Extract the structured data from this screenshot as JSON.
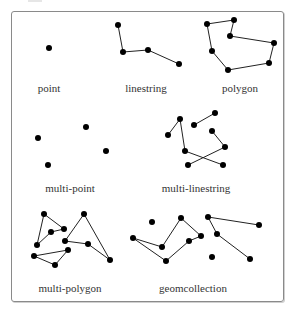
{
  "figure": {
    "stroke_color": "#222222",
    "vertex_color": "#000000",
    "vertex_radius": 3,
    "panels": [
      {
        "id": "point",
        "label": "point",
        "label_pos": [
          49,
          94
        ],
        "points": [
          [
            49,
            48
          ]
        ],
        "lines": [],
        "polygons": []
      },
      {
        "id": "linestring",
        "label": "linestring",
        "label_pos": [
          146,
          94
        ],
        "points": [],
        "lines": [
          [
            [
              118,
              25
            ],
            [
              123,
              52
            ],
            [
              148,
              50
            ],
            [
              179,
              64
            ]
          ]
        ],
        "polygons": []
      },
      {
        "id": "polygon",
        "label": "polygon",
        "label_pos": [
          240,
          94
        ],
        "points": [],
        "lines": [],
        "polygons": [
          [
            [
              207,
              24
            ],
            [
              234,
              20
            ],
            [
              230,
              36
            ],
            [
              274,
              43
            ],
            [
              269,
              63
            ],
            [
              228,
              70
            ],
            [
              212,
              51
            ]
          ]
        ]
      },
      {
        "id": "multi-point",
        "label": "multi-point",
        "label_pos": [
          70,
          194
        ],
        "points": [
          [
            38,
            138
          ],
          [
            86,
            127
          ],
          [
            106,
            151
          ],
          [
            48,
            165
          ]
        ],
        "lines": [],
        "polygons": []
      },
      {
        "id": "multi-linestring",
        "label": "multi-linestring",
        "label_pos": [
          196,
          194
        ],
        "points": [],
        "lines": [
          [
            [
              168,
              135
            ],
            [
              180,
              119
            ],
            [
              185,
              151
            ],
            [
              223,
              165
            ]
          ],
          [
            [
              194,
              125
            ],
            [
              215,
              113
            ]
          ],
          [
            [
              212,
              131
            ],
            [
              225,
              147
            ],
            [
              188,
              165
            ]
          ]
        ],
        "polygons": []
      },
      {
        "id": "multi-polygon",
        "label": "multi-polygon",
        "label_pos": [
          70,
          294
        ],
        "points": [],
        "lines": [],
        "polygons": [
          [
            [
              44,
              214
            ],
            [
              64,
              229
            ],
            [
              51,
              232
            ],
            [
              37,
              245
            ]
          ],
          [
            [
              34,
              256
            ],
            [
              68,
              250
            ],
            [
              55,
              265
            ]
          ],
          [
            [
              84,
              214
            ],
            [
              110,
              260
            ],
            [
              88,
              244
            ],
            [
              65,
              241
            ]
          ]
        ]
      },
      {
        "id": "geomcollection",
        "label": "geomcollection",
        "label_pos": [
          193,
          294
        ],
        "points": [
          [
            152,
            222
          ],
          [
            212,
            257
          ]
        ],
        "lines": [
          [
            [
              259,
              225
            ],
            [
              208,
              217
            ],
            [
              217,
              234
            ],
            [
              250,
              259
            ]
          ]
        ],
        "polygons": [
          [
            [
              133,
              238
            ],
            [
              162,
              247
            ],
            [
              181,
              218
            ],
            [
              201,
              236
            ],
            [
              189,
              241
            ],
            [
              166,
              261
            ]
          ]
        ]
      }
    ]
  }
}
